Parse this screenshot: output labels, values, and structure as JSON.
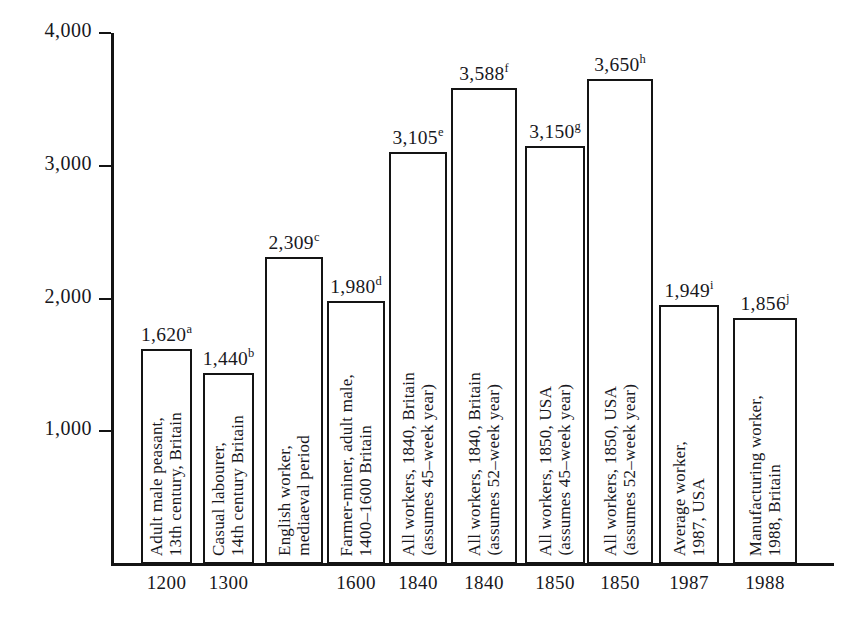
{
  "chart_data": {
    "type": "bar",
    "title": "",
    "subtitle": "",
    "xlabel": "",
    "ylabel": "",
    "ylim": [
      0,
      4000
    ],
    "grid": false,
    "legend": null,
    "y_ticks": [
      "1,000",
      "2,000",
      "3,000",
      "4,000"
    ],
    "y_tick_values": [
      1000,
      2000,
      3000,
      4000
    ],
    "categories": [
      "1200",
      "1300",
      "",
      "1600",
      "1840",
      "1840",
      "1850",
      "1850",
      "1987",
      "1988"
    ],
    "values": [
      1620,
      1440,
      2309,
      1980,
      3105,
      3588,
      3150,
      3650,
      1949,
      1856
    ],
    "value_labels": [
      "1,620",
      "1,440",
      "2,309",
      "1,980",
      "3,105",
      "3,588",
      "3,150",
      "3,650",
      "1,949",
      "1,856"
    ],
    "footnote_marks": [
      "a",
      "b",
      "c",
      "d",
      "e",
      "f",
      "g",
      "h",
      "i",
      "j"
    ],
    "bars": [
      {
        "value": 1620,
        "value_label": "1,620",
        "mark": "a",
        "x_label": "1200",
        "caption_lines": [
          "Adult male peasant,",
          "13th century, Britain"
        ]
      },
      {
        "value": 1440,
        "value_label": "1,440",
        "mark": "b",
        "x_label": "1300",
        "caption_lines": [
          "Casual labourer,",
          "14th century Britain"
        ]
      },
      {
        "value": 2309,
        "value_label": "2,309",
        "mark": "c",
        "x_label": "",
        "caption_lines": [
          "English worker,",
          "mediaeval period"
        ]
      },
      {
        "value": 1980,
        "value_label": "1,980",
        "mark": "d",
        "x_label": "1600",
        "caption_lines": [
          "Farmer-miner, adult male,",
          "1400–1600 Britain"
        ]
      },
      {
        "value": 3105,
        "value_label": "3,105",
        "mark": "e",
        "x_label": "1840",
        "caption_lines": [
          "All workers, 1840, Britain",
          "(assumes 45–week year)"
        ]
      },
      {
        "value": 3588,
        "value_label": "3,588",
        "mark": "f",
        "x_label": "1840",
        "caption_lines": [
          "All workers, 1840, Britain",
          "(assumes 52–week year)"
        ]
      },
      {
        "value": 3150,
        "value_label": "3,150",
        "mark": "g",
        "x_label": "1850",
        "caption_lines": [
          "All workers, 1850, USA",
          "(assumes 45–week year)"
        ]
      },
      {
        "value": 3650,
        "value_label": "3,650",
        "mark": "h",
        "x_label": "1850",
        "caption_lines": [
          "All workers, 1850, USA",
          "(assumes 52–week year)"
        ]
      },
      {
        "value": 1949,
        "value_label": "1,949",
        "mark": "i",
        "x_label": "1987",
        "caption_lines": [
          "Average worker,",
          "1987, USA"
        ]
      },
      {
        "value": 1856,
        "value_label": "1,856",
        "mark": "j",
        "x_label": "1988",
        "caption_lines": [
          "Manufacturing worker,",
          "1988, Britain"
        ]
      }
    ]
  },
  "colors": {
    "ink": "#141414",
    "background": "#ffffff"
  }
}
